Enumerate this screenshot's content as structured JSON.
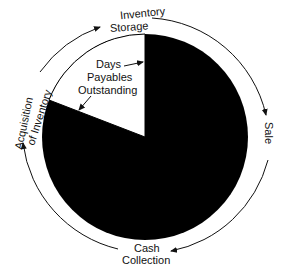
{
  "diagram": {
    "type": "cycle",
    "pie": {
      "filled_color": "#000000",
      "wedge_color": "#ffffff",
      "wedge_label": [
        "Days",
        "Payables",
        "Outstanding"
      ]
    },
    "stages": {
      "top": [
        "Inventory",
        "Storage"
      ],
      "right": "Sale",
      "bottom": [
        "Cash",
        "Collection"
      ],
      "left": [
        "Acquisition",
        "of Inventory"
      ]
    }
  }
}
